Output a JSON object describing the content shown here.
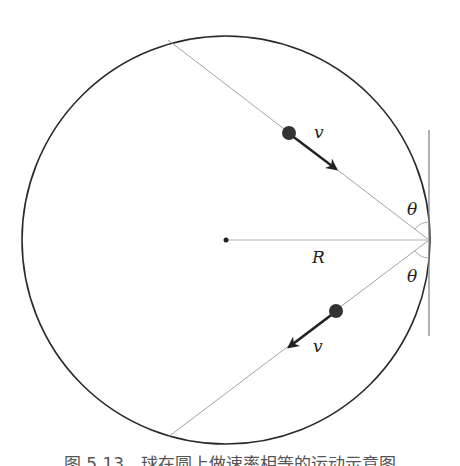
{
  "figure": {
    "type": "physics-diagram",
    "circle": {
      "cx": 226,
      "cy": 240,
      "r": 204,
      "stroke": "#2a2a2a"
    },
    "center_dot": {
      "x": 226,
      "y": 240
    },
    "contact_point": {
      "x": 429,
      "y": 240
    },
    "tangent_line": {
      "x": 429,
      "y1": 130,
      "y2": 336,
      "stroke": "#777777"
    },
    "chords": [
      {
        "name": "incoming-chord",
        "x1": 168,
        "y1": 40,
        "x2": 429,
        "y2": 240
      },
      {
        "name": "outgoing-chord",
        "x1": 429,
        "y1": 240,
        "x2": 168,
        "y2": 437
      }
    ],
    "radius_line": {
      "x1": 226,
      "y1": 240,
      "x2": 429,
      "y2": 240
    },
    "balls": [
      {
        "name": "incoming-ball",
        "x": 289,
        "y": 133,
        "r": 7,
        "fill": "#333333"
      },
      {
        "name": "outgoing-ball",
        "x": 336,
        "y": 311,
        "r": 7,
        "fill": "#333333"
      }
    ],
    "velocity_arrows": [
      {
        "name": "incoming-velocity-arrow",
        "x1": 289,
        "y1": 133,
        "x2": 337,
        "y2": 170
      },
      {
        "name": "outgoing-velocity-arrow",
        "x1": 336,
        "y1": 311,
        "x2": 288,
        "y2": 348
      }
    ]
  },
  "labels": {
    "v_top": "v",
    "v_bottom": "v",
    "theta_top": "θ",
    "theta_bottom": "θ",
    "radius": "R"
  },
  "caption": "图 5.13　球在圆上做速率相等的运动示意图"
}
